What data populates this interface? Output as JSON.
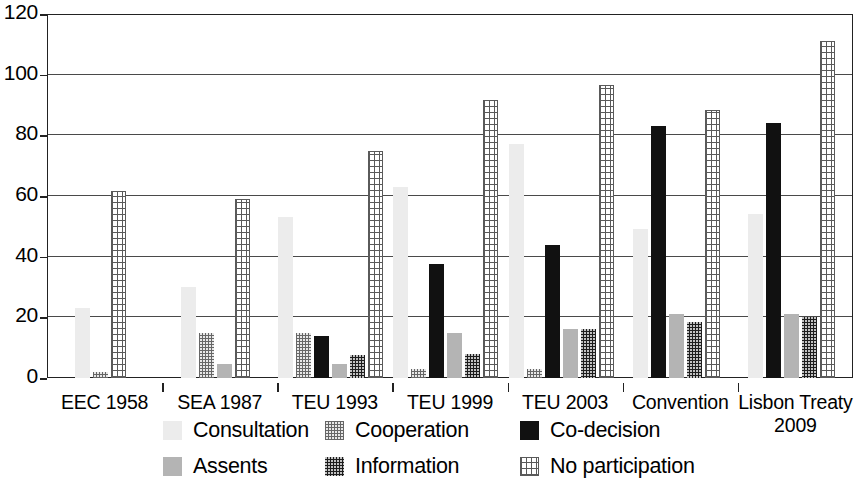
{
  "chart_data": {
    "type": "bar",
    "title": "",
    "subtitle": "",
    "xlabel": "",
    "ylabel": "",
    "ylim": [
      0,
      120
    ],
    "yticks": [
      0,
      20,
      40,
      60,
      80,
      100,
      120
    ],
    "grid": true,
    "legend_position": "bottom",
    "categories": [
      "EEC 1958",
      "SEA 1987",
      "TEU 1993",
      "TEU 1999",
      "TEU 2003",
      "Convention",
      "Lisbon Treaty 2009"
    ],
    "category_lines": [
      [
        "EEC 1958"
      ],
      [
        "SEA 1987"
      ],
      [
        "TEU 1993"
      ],
      [
        "TEU 1999"
      ],
      [
        "TEU 2003"
      ],
      [
        "Convention"
      ],
      [
        "Lisbon Treaty",
        "2009"
      ]
    ],
    "series": [
      {
        "name": "Consultation",
        "color": "#ececec",
        "pattern": "light-speckle",
        "values": [
          23,
          30,
          53,
          63,
          77,
          49,
          54
        ]
      },
      {
        "name": "Cooperation",
        "color": "#e8e8e8",
        "pattern": "fine-grid",
        "values": [
          2,
          15,
          15,
          3,
          3,
          0,
          0
        ]
      },
      {
        "name": "Co-decision",
        "color": "#111111",
        "pattern": "solid-black",
        "values": [
          0,
          0,
          14,
          37.5,
          44,
          83,
          84
        ]
      },
      {
        "name": "Assents",
        "color": "#b4b4b4",
        "pattern": "solid-gray",
        "values": [
          0,
          4.5,
          4.5,
          15,
          16,
          21,
          21
        ]
      },
      {
        "name": "Information",
        "color": "#1d1d1d",
        "pattern": "dark-speckle",
        "values": [
          0,
          0,
          7.5,
          8,
          16,
          18.5,
          20
        ]
      },
      {
        "name": "No participation",
        "color": "#ffffff",
        "pattern": "crosshatch",
        "values": [
          61.5,
          59,
          75,
          91.5,
          96.5,
          88.5,
          111
        ]
      }
    ]
  },
  "legend": {
    "items": [
      {
        "label": "Consultation"
      },
      {
        "label": "Cooperation"
      },
      {
        "label": "Co-decision"
      },
      {
        "label": "Assents"
      },
      {
        "label": "Information"
      },
      {
        "label": "No participation"
      }
    ]
  }
}
